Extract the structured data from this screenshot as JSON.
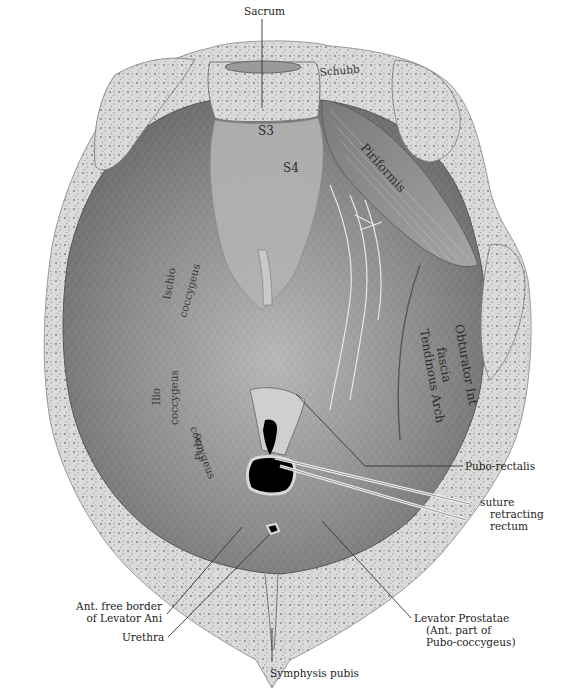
{
  "figure": {
    "colors": {
      "background": "#ffffff",
      "bone": "#d9d9d9",
      "bone_speckle": "#8a8a8a",
      "muscle_dark": "#6e6e6e",
      "muscle_mid": "#9a9a9a",
      "muscle_light": "#c4c4c4",
      "opening": "#000000",
      "leader_line": "#333333"
    }
  },
  "labels": {
    "sacrum": "Sacrum",
    "s3": "S3",
    "s4": "S4",
    "piriformis": "Piriformis",
    "ischio_coccygeus_1": "Ischio",
    "ischio_coccygeus_2": "coccygeus",
    "ilio_coccygeus_1": "Ilio",
    "ilio_coccygeus_2": "coccygeus",
    "pubo_coccygeus_1": "Pubo",
    "pubo_coccygeus_2": "coccygeus",
    "obturator_1": "Obturator Int",
    "obturator_2": "fascia",
    "tendinous_arch": "Tendinous Arch",
    "pubo_rectalis": "Pubo-rectalis",
    "suture_1": "suture",
    "suture_2": "retracting",
    "suture_3": "rectum",
    "ant_free_border_1": "Ant. free border",
    "ant_free_border_2": "of Levator Ani",
    "urethra": "Urethra",
    "levator_prostatae_1": "Levator Prostatae",
    "levator_prostatae_2": "(Ant. part of",
    "levator_prostatae_3": "Pubo-coccygeus)",
    "symphysis_pubis": "Symphysis pubis",
    "signature": "Schubb"
  }
}
